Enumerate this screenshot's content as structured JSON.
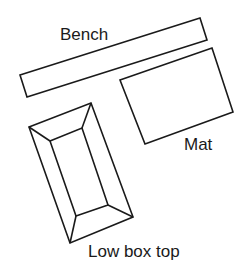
{
  "diagram": {
    "type": "floor-plan-equipment-layout",
    "items": [
      {
        "id": "bench",
        "label": "Bench",
        "points": [
          [
            20,
            75
          ],
          [
            200,
            18
          ],
          [
            207,
            40
          ],
          [
            27,
            97
          ]
        ],
        "label_pos": [
          60,
          40
        ]
      },
      {
        "id": "mat",
        "label": "Mat",
        "points": [
          [
            120,
            80
          ],
          [
            212,
            48
          ],
          [
            233,
            112
          ],
          [
            145,
            144
          ]
        ],
        "label_pos": [
          184,
          150
        ]
      },
      {
        "id": "low-box-top",
        "label": "Low box top",
        "outer": [
          [
            29,
            127
          ],
          [
            91,
            103
          ],
          [
            133,
            217
          ],
          [
            70,
            243
          ]
        ],
        "inner": [
          [
            50,
            141
          ],
          [
            82,
            128
          ],
          [
            108,
            205
          ],
          [
            76,
            216
          ]
        ],
        "label_pos": [
          88,
          257
        ]
      }
    ],
    "stroke_color": "#1a1a1a",
    "background": "#ffffff"
  }
}
